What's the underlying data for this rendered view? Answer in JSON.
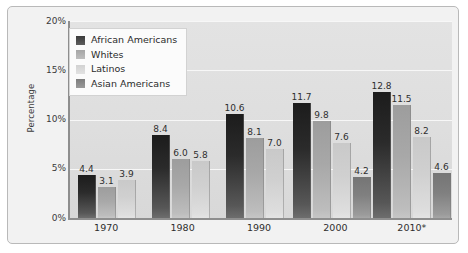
{
  "chart_data": {
    "type": "bar",
    "title": "",
    "xlabel": "",
    "ylabel": "Percentage",
    "ylim": [
      0,
      20
    ],
    "yticks": [
      "0%",
      "5%",
      "10%",
      "15%",
      "20%"
    ],
    "grid": true,
    "legend_position": "top-left",
    "categories": [
      "1970",
      "1980",
      "1990",
      "2000",
      "2010*"
    ],
    "series": [
      {
        "name": "African Americans",
        "color": "#2b2b2b",
        "values": [
          4.4,
          8.4,
          10.6,
          11.7,
          12.8
        ]
      },
      {
        "name": "Whites",
        "color": "#a8a8a8",
        "values": [
          3.1,
          6.0,
          8.1,
          9.8,
          11.5
        ]
      },
      {
        "name": "Latinos",
        "color": "#d0d0d0",
        "values": [
          3.9,
          5.8,
          7.0,
          7.6,
          8.2
        ]
      },
      {
        "name": "Asian Americans",
        "color": "#808080",
        "values": [
          null,
          null,
          null,
          4.2,
          4.6
        ]
      }
    ],
    "bar_labels": {
      "1970": [
        "4.4",
        "3.1",
        "3.9"
      ],
      "1980": [
        "8.4",
        "6.0",
        "5.8"
      ],
      "1990": [
        "10.6",
        "8.1",
        "7.0"
      ],
      "2000": [
        "11.7",
        "9.8",
        "7.6",
        "4.2"
      ],
      "2010*": [
        "12.8",
        "11.5",
        "8.2",
        "4.6"
      ]
    }
  },
  "legend": {
    "items": [
      {
        "label": "African Americans"
      },
      {
        "label": "Whites"
      },
      {
        "label": "Latinos"
      },
      {
        "label": "Asian Americans"
      }
    ]
  }
}
